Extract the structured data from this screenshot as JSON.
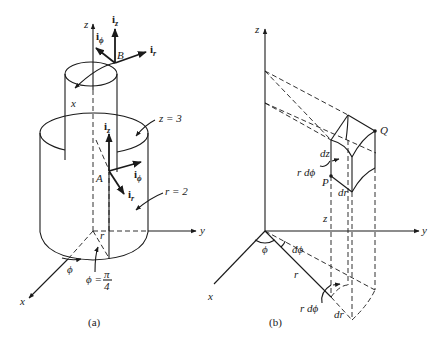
{
  "figure_a": {
    "caption": "(a)",
    "axes": {
      "x": "x",
      "y": "y",
      "z": "z"
    },
    "points": {
      "A": "A",
      "B": "B"
    },
    "unit_vectors_B": {
      "iz": "i",
      "iz_sub": "z",
      "ir": "i",
      "ir_sub": "r",
      "iphi": "i",
      "iphi_sub": "ϕ"
    },
    "unit_vectors_A": {
      "iz": "i",
      "iz_sub": "z",
      "ir": "i",
      "ir_sub": "r",
      "iphi": "i",
      "iphi_sub": "ϕ"
    },
    "annotations": {
      "plane_z": "z = 3",
      "cylinder_r": "r = 2",
      "r_label": "r",
      "phi_label": "ϕ",
      "phi_value_lhs": "ϕ =",
      "phi_value_num": "π",
      "phi_value_den": "4",
      "x_label_small": "x"
    }
  },
  "figure_b": {
    "caption": "(b)",
    "axes": {
      "x": "x",
      "y": "y",
      "z": "z"
    },
    "points": {
      "P": "P",
      "Q": "Q"
    },
    "annotations": {
      "dz": "dz",
      "r_dphi_top": "r dϕ",
      "dr_top": "dr",
      "z": "z",
      "phi": "ϕ",
      "dphi": "dϕ",
      "r": "r",
      "r_dphi_bottom": "r dϕ",
      "dr_bottom": "dr"
    }
  }
}
